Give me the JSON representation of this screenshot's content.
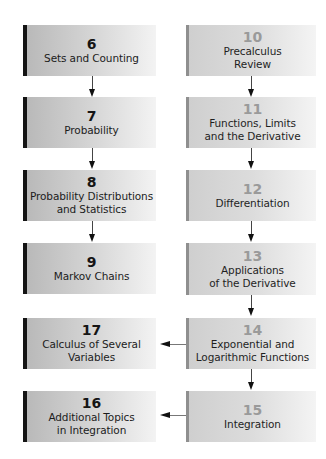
{
  "diagram": {
    "type": "chapter-dependency-flowchart",
    "left_column": [
      {
        "number": "6",
        "title_lines": [
          "Sets and Counting"
        ]
      },
      {
        "number": "7",
        "title_lines": [
          "Probability"
        ]
      },
      {
        "number": "8",
        "title_lines": [
          "Probability Distributions",
          "and Statistics"
        ]
      },
      {
        "number": "9",
        "title_lines": [
          "Markov Chains"
        ]
      },
      {
        "number": "17",
        "title_lines": [
          "Calculus of Several",
          "Variables"
        ]
      },
      {
        "number": "16",
        "title_lines": [
          "Additional Topics",
          "in Integration"
        ]
      }
    ],
    "right_column": [
      {
        "number": "10",
        "title_lines": [
          "Precalculus",
          "Review"
        ]
      },
      {
        "number": "11",
        "title_lines": [
          "Functions, Limits",
          "and the Derivative"
        ]
      },
      {
        "number": "12",
        "title_lines": [
          "Differentiation"
        ]
      },
      {
        "number": "13",
        "title_lines": [
          "Applications",
          "of the Derivative"
        ]
      },
      {
        "number": "14",
        "title_lines": [
          "Exponential and",
          "Logarithmic Functions"
        ]
      },
      {
        "number": "15",
        "title_lines": [
          "Integration"
        ]
      }
    ],
    "edges": [
      {
        "from": "6",
        "to": "7"
      },
      {
        "from": "7",
        "to": "8"
      },
      {
        "from": "8",
        "to": "9"
      },
      {
        "from": "10",
        "to": "11"
      },
      {
        "from": "11",
        "to": "12"
      },
      {
        "from": "12",
        "to": "13"
      },
      {
        "from": "13",
        "to": "14"
      },
      {
        "from": "14",
        "to": "15"
      },
      {
        "from": "14",
        "to": "17"
      },
      {
        "from": "15",
        "to": "16"
      }
    ],
    "colors": {
      "left_accent_bar": "#141414",
      "right_accent_bar": "#8f8f8f",
      "left_number": "#151515",
      "right_number": "#9a9a9a",
      "arrow": "#111111"
    }
  }
}
